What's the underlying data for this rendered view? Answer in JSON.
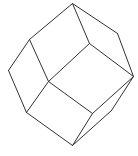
{
  "figure": {
    "type": "polyhedron-line-drawing",
    "shape": "rhombic-dodecahedron",
    "stroke_color": "#333333",
    "background": "#ffffff",
    "vertices": {
      "top": [
        72,
        3
      ],
      "upper_left": [
        29,
        39
      ],
      "upper_right": [
        117,
        33
      ],
      "inner_top": [
        89,
        43
      ],
      "left": [
        8,
        70
      ],
      "center": [
        48,
        81
      ],
      "right": [
        133,
        76
      ],
      "lower_left": [
        26,
        112
      ],
      "inner_lower_right": [
        92,
        113
      ],
      "right_lower": [
        111,
        110
      ],
      "bottom": [
        72,
        145
      ]
    },
    "edges": [
      [
        "top",
        "upper_left"
      ],
      [
        "top",
        "upper_right"
      ],
      [
        "top",
        "inner_top"
      ],
      [
        "upper_left",
        "left"
      ],
      [
        "upper_left",
        "center"
      ],
      [
        "upper_right",
        "right"
      ],
      [
        "inner_top",
        "center"
      ],
      [
        "inner_top",
        "right"
      ],
      [
        "left",
        "lower_left"
      ],
      [
        "center",
        "lower_left"
      ],
      [
        "center",
        "inner_lower_right"
      ],
      [
        "right",
        "inner_lower_right"
      ],
      [
        "right",
        "right_lower"
      ],
      [
        "lower_left",
        "bottom"
      ],
      [
        "inner_lower_right",
        "bottom"
      ],
      [
        "right_lower",
        "bottom"
      ]
    ]
  }
}
